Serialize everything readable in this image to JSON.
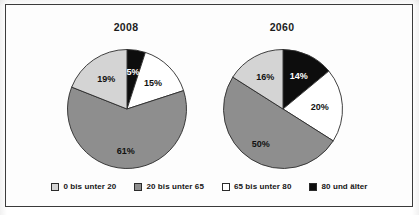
{
  "figure": {
    "border_color": "#3a3a3a",
    "background": "#ffffff"
  },
  "palette": {
    "age_0_20": "#d4d4d4",
    "age_20_65": "#8e8e8e",
    "age_65_80": "#ffffff",
    "age_80_plus": "#0d0d0d",
    "outline": "#2b2b2b"
  },
  "legend": {
    "items": [
      {
        "label": "0 bis unter 20",
        "color": "#d4d4d4",
        "swatch_name": "legend-swatch-0-bis-unter-20"
      },
      {
        "label": "20 bis unter 65",
        "color": "#8e8e8e",
        "swatch_name": "legend-swatch-20-bis-unter-65"
      },
      {
        "label": "65 bis unter 80",
        "color": "#ffffff",
        "swatch_name": "legend-swatch-65-bis-unter-80"
      },
      {
        "label": "80 und älter",
        "color": "#0d0d0d",
        "swatch_name": "legend-swatch-80-und-aelter"
      }
    ]
  },
  "charts": [
    {
      "title": "2008",
      "labels": [
        "5%",
        "15%",
        "61%",
        "19%"
      ]
    },
    {
      "title": "2060",
      "labels": [
        "14%",
        "20%",
        "50%",
        "16%"
      ]
    }
  ],
  "chart_data": [
    {
      "type": "pie",
      "title": "2008",
      "categories": [
        "80 und älter",
        "65 bis unter 80",
        "20 bis unter 65",
        "0 bis unter 20"
      ],
      "values": [
        5,
        15,
        61,
        19
      ],
      "value_labels": [
        "5%",
        "15%",
        "61%",
        "19%"
      ],
      "colors": [
        "#0d0d0d",
        "#ffffff",
        "#8e8e8e",
        "#d4d4d4"
      ],
      "units": "percent",
      "start_angle_deg": 0,
      "direction": "clockwise",
      "xlabel": "",
      "ylabel": "",
      "legend_position": "bottom",
      "grid": false
    },
    {
      "type": "pie",
      "title": "2060",
      "categories": [
        "80 und älter",
        "65 bis unter 80",
        "20 bis unter 65",
        "0 bis unter 20"
      ],
      "values": [
        14,
        20,
        50,
        16
      ],
      "value_labels": [
        "14%",
        "20%",
        "50%",
        "16%"
      ],
      "colors": [
        "#0d0d0d",
        "#ffffff",
        "#8e8e8e",
        "#d4d4d4"
      ],
      "units": "percent",
      "start_angle_deg": 0,
      "direction": "clockwise",
      "xlabel": "",
      "ylabel": "",
      "legend_position": "bottom",
      "grid": false
    }
  ]
}
